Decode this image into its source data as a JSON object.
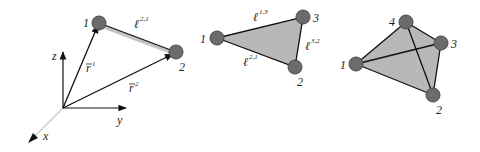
{
  "colors": {
    "node_fill": "#6b6b6b",
    "node_stroke": "#4a4a4a",
    "edge": "#111111",
    "face_fill": "#b8b8b8",
    "axis": "#111111",
    "x_axis": "#c8c8c8",
    "highlight_edge": "#bdbdbd"
  },
  "diagram1": {
    "nodes": [
      {
        "id": "1",
        "label": "1"
      },
      {
        "id": "2",
        "label": "2"
      }
    ],
    "axes": {
      "z": "z",
      "y": "y",
      "x": "x"
    },
    "vectors": [
      {
        "name": "r",
        "superscript": "1"
      },
      {
        "name": "r",
        "superscript": "2"
      }
    ],
    "edge_label": {
      "name": "ℓ",
      "superscript": "2,1"
    }
  },
  "diagram2": {
    "nodes": [
      {
        "id": "1",
        "label": "1"
      },
      {
        "id": "2",
        "label": "2"
      },
      {
        "id": "3",
        "label": "3"
      }
    ],
    "edge_labels": [
      {
        "name": "ℓ",
        "superscript": "1,3"
      },
      {
        "name": "ℓ",
        "superscript": "3,2"
      },
      {
        "name": "ℓ",
        "superscript": "2,1"
      }
    ]
  },
  "diagram3": {
    "nodes": [
      {
        "id": "1",
        "label": "1"
      },
      {
        "id": "2",
        "label": "2"
      },
      {
        "id": "3",
        "label": "3"
      },
      {
        "id": "4",
        "label": "4"
      }
    ]
  }
}
